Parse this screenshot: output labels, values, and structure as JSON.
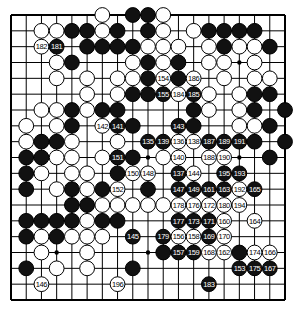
{
  "diagram": {
    "type": "go-board",
    "size": 19,
    "background": "#ffffff",
    "line_color": "#000000",
    "black_color": "#111111",
    "white_color": "#ffffff",
    "star_points": [
      [
        3,
        15
      ],
      [
        9,
        9
      ],
      [
        9,
        15
      ],
      [
        15,
        3
      ],
      [
        15,
        9
      ]
    ],
    "stones": [
      {
        "r": 0,
        "c": 6,
        "color": "W"
      },
      {
        "r": 0,
        "c": 8,
        "color": "B"
      },
      {
        "r": 0,
        "c": 9,
        "color": "B"
      },
      {
        "r": 0,
        "c": 10,
        "color": "W"
      },
      {
        "r": 1,
        "c": 2,
        "color": "W"
      },
      {
        "r": 1,
        "c": 3,
        "color": "W"
      },
      {
        "r": 1,
        "c": 4,
        "color": "B"
      },
      {
        "r": 1,
        "c": 5,
        "color": "B"
      },
      {
        "r": 1,
        "c": 6,
        "color": "W"
      },
      {
        "r": 1,
        "c": 7,
        "color": "B"
      },
      {
        "r": 1,
        "c": 9,
        "color": "B"
      },
      {
        "r": 1,
        "c": 10,
        "color": "W"
      },
      {
        "r": 1,
        "c": 12,
        "color": "W"
      },
      {
        "r": 1,
        "c": 13,
        "color": "B"
      },
      {
        "r": 1,
        "c": 14,
        "color": "B"
      },
      {
        "r": 1,
        "c": 15,
        "color": "B"
      },
      {
        "r": 1,
        "c": 16,
        "color": "B"
      },
      {
        "r": 2,
        "c": 2,
        "color": "W",
        "label": "182"
      },
      {
        "r": 2,
        "c": 3,
        "color": "B",
        "label": "181"
      },
      {
        "r": 2,
        "c": 5,
        "color": "B"
      },
      {
        "r": 2,
        "c": 6,
        "color": "B"
      },
      {
        "r": 2,
        "c": 7,
        "color": "B"
      },
      {
        "r": 2,
        "c": 8,
        "color": "B"
      },
      {
        "r": 2,
        "c": 9,
        "color": "W"
      },
      {
        "r": 2,
        "c": 10,
        "color": "W"
      },
      {
        "r": 2,
        "c": 11,
        "color": "W"
      },
      {
        "r": 2,
        "c": 13,
        "color": "W"
      },
      {
        "r": 2,
        "c": 14,
        "color": "B"
      },
      {
        "r": 2,
        "c": 15,
        "color": "W"
      },
      {
        "r": 2,
        "c": 16,
        "color": "W"
      },
      {
        "r": 2,
        "c": 17,
        "color": "B"
      },
      {
        "r": 3,
        "c": 3,
        "color": "W"
      },
      {
        "r": 3,
        "c": 4,
        "color": "B"
      },
      {
        "r": 3,
        "c": 8,
        "color": "W"
      },
      {
        "r": 3,
        "c": 9,
        "color": "B"
      },
      {
        "r": 3,
        "c": 10,
        "color": "W"
      },
      {
        "r": 3,
        "c": 11,
        "color": "B"
      },
      {
        "r": 3,
        "c": 13,
        "color": "W"
      },
      {
        "r": 3,
        "c": 14,
        "color": "W"
      },
      {
        "r": 3,
        "c": 16,
        "color": "W"
      },
      {
        "r": 4,
        "c": 3,
        "color": "W"
      },
      {
        "r": 4,
        "c": 5,
        "color": "W"
      },
      {
        "r": 4,
        "c": 7,
        "color": "W"
      },
      {
        "r": 4,
        "c": 8,
        "color": "W"
      },
      {
        "r": 4,
        "c": 9,
        "color": "B"
      },
      {
        "r": 4,
        "c": 10,
        "color": "W",
        "label": "154"
      },
      {
        "r": 4,
        "c": 11,
        "color": "B"
      },
      {
        "r": 4,
        "c": 12,
        "color": "W",
        "label": "186"
      },
      {
        "r": 4,
        "c": 14,
        "color": "W"
      },
      {
        "r": 4,
        "c": 16,
        "color": "W"
      },
      {
        "r": 4,
        "c": 17,
        "color": "W"
      },
      {
        "r": 5,
        "c": 5,
        "color": "W"
      },
      {
        "r": 5,
        "c": 7,
        "color": "W"
      },
      {
        "r": 5,
        "c": 8,
        "color": "B"
      },
      {
        "r": 5,
        "c": 9,
        "color": "B"
      },
      {
        "r": 5,
        "c": 10,
        "color": "B",
        "label": "155"
      },
      {
        "r": 5,
        "c": 11,
        "color": "W",
        "label": "184"
      },
      {
        "r": 5,
        "c": 12,
        "color": "B",
        "label": "185"
      },
      {
        "r": 5,
        "c": 13,
        "color": "W"
      },
      {
        "r": 5,
        "c": 15,
        "color": "W"
      },
      {
        "r": 5,
        "c": 16,
        "color": "B"
      },
      {
        "r": 5,
        "c": 17,
        "color": "B"
      },
      {
        "r": 6,
        "c": 2,
        "color": "W"
      },
      {
        "r": 6,
        "c": 3,
        "color": "W"
      },
      {
        "r": 6,
        "c": 4,
        "color": "B"
      },
      {
        "r": 6,
        "c": 5,
        "color": "W"
      },
      {
        "r": 6,
        "c": 6,
        "color": "B"
      },
      {
        "r": 6,
        "c": 7,
        "color": "B"
      },
      {
        "r": 6,
        "c": 12,
        "color": "B"
      },
      {
        "r": 6,
        "c": 13,
        "color": "W"
      },
      {
        "r": 6,
        "c": 15,
        "color": "W"
      },
      {
        "r": 6,
        "c": 16,
        "color": "B"
      },
      {
        "r": 6,
        "c": 18,
        "color": "B"
      },
      {
        "r": 7,
        "c": 1,
        "color": "W"
      },
      {
        "r": 7,
        "c": 3,
        "color": "W"
      },
      {
        "r": 7,
        "c": 4,
        "color": "B"
      },
      {
        "r": 7,
        "c": 6,
        "color": "W",
        "label": "142"
      },
      {
        "r": 7,
        "c": 7,
        "color": "B",
        "label": "141"
      },
      {
        "r": 7,
        "c": 8,
        "color": "B"
      },
      {
        "r": 7,
        "c": 11,
        "color": "B",
        "label": "143"
      },
      {
        "r": 7,
        "c": 12,
        "color": "B"
      },
      {
        "r": 7,
        "c": 15,
        "color": "W"
      },
      {
        "r": 7,
        "c": 16,
        "color": "W"
      },
      {
        "r": 7,
        "c": 17,
        "color": "B"
      },
      {
        "r": 8,
        "c": 1,
        "color": "W"
      },
      {
        "r": 8,
        "c": 2,
        "color": "B"
      },
      {
        "r": 8,
        "c": 3,
        "color": "B"
      },
      {
        "r": 8,
        "c": 4,
        "color": "W"
      },
      {
        "r": 8,
        "c": 7,
        "color": "W"
      },
      {
        "r": 8,
        "c": 9,
        "color": "B",
        "label": "135"
      },
      {
        "r": 8,
        "c": 10,
        "color": "B",
        "label": "139"
      },
      {
        "r": 8,
        "c": 11,
        "color": "W",
        "label": "136"
      },
      {
        "r": 8,
        "c": 12,
        "color": "W",
        "label": "138"
      },
      {
        "r": 8,
        "c": 13,
        "color": "B",
        "label": "187"
      },
      {
        "r": 8,
        "c": 14,
        "color": "B",
        "label": "189"
      },
      {
        "r": 8,
        "c": 15,
        "color": "B",
        "label": "191"
      },
      {
        "r": 8,
        "c": 16,
        "color": "B"
      },
      {
        "r": 8,
        "c": 18,
        "color": "B"
      },
      {
        "r": 9,
        "c": 1,
        "color": "B"
      },
      {
        "r": 9,
        "c": 2,
        "color": "B"
      },
      {
        "r": 9,
        "c": 3,
        "color": "W"
      },
      {
        "r": 9,
        "c": 4,
        "color": "W"
      },
      {
        "r": 9,
        "c": 6,
        "color": "W"
      },
      {
        "r": 9,
        "c": 7,
        "color": "B",
        "label": "151"
      },
      {
        "r": 9,
        "c": 8,
        "color": "B"
      },
      {
        "r": 9,
        "c": 10,
        "color": "W"
      },
      {
        "r": 9,
        "c": 11,
        "color": "W",
        "label": "140"
      },
      {
        "r": 9,
        "c": 13,
        "color": "W",
        "label": "188"
      },
      {
        "r": 9,
        "c": 14,
        "color": "W",
        "label": "190"
      },
      {
        "r": 9,
        "c": 17,
        "color": "B"
      },
      {
        "r": 10,
        "c": 1,
        "color": "B"
      },
      {
        "r": 10,
        "c": 2,
        "color": "W"
      },
      {
        "r": 10,
        "c": 4,
        "color": "W"
      },
      {
        "r": 10,
        "c": 5,
        "color": "W"
      },
      {
        "r": 10,
        "c": 7,
        "color": "B"
      },
      {
        "r": 10,
        "c": 8,
        "color": "W",
        "label": "150"
      },
      {
        "r": 10,
        "c": 9,
        "color": "W",
        "label": "148"
      },
      {
        "r": 10,
        "c": 11,
        "color": "B",
        "label": "137"
      },
      {
        "r": 10,
        "c": 12,
        "color": "W",
        "label": "144"
      },
      {
        "r": 10,
        "c": 14,
        "color": "B",
        "label": "195"
      },
      {
        "r": 10,
        "c": 15,
        "color": "B",
        "label": "193"
      },
      {
        "r": 11,
        "c": 1,
        "color": "B"
      },
      {
        "r": 11,
        "c": 3,
        "color": "W"
      },
      {
        "r": 11,
        "c": 4,
        "color": "B"
      },
      {
        "r": 11,
        "c": 5,
        "color": "W"
      },
      {
        "r": 11,
        "c": 6,
        "color": "B"
      },
      {
        "r": 11,
        "c": 7,
        "color": "W",
        "label": "152"
      },
      {
        "r": 11,
        "c": 9,
        "color": "B"
      },
      {
        "r": 11,
        "c": 11,
        "color": "B",
        "label": "147"
      },
      {
        "r": 11,
        "c": 12,
        "color": "B",
        "label": "149"
      },
      {
        "r": 11,
        "c": 13,
        "color": "B",
        "label": "161"
      },
      {
        "r": 11,
        "c": 14,
        "color": "B",
        "label": "163"
      },
      {
        "r": 11,
        "c": 15,
        "color": "W",
        "label": "192"
      },
      {
        "r": 11,
        "c": 16,
        "color": "B",
        "label": "165"
      },
      {
        "r": 12,
        "c": 4,
        "color": "B"
      },
      {
        "r": 12,
        "c": 5,
        "color": "B"
      },
      {
        "r": 12,
        "c": 6,
        "color": "W"
      },
      {
        "r": 12,
        "c": 7,
        "color": "W"
      },
      {
        "r": 12,
        "c": 8,
        "color": "W"
      },
      {
        "r": 12,
        "c": 9,
        "color": "W"
      },
      {
        "r": 12,
        "c": 10,
        "color": "W"
      },
      {
        "r": 12,
        "c": 11,
        "color": "W",
        "label": "178"
      },
      {
        "r": 12,
        "c": 12,
        "color": "W",
        "label": "176"
      },
      {
        "r": 12,
        "c": 13,
        "color": "W",
        "label": "172"
      },
      {
        "r": 12,
        "c": 14,
        "color": "W",
        "label": "180"
      },
      {
        "r": 12,
        "c": 15,
        "color": "W",
        "label": "194"
      },
      {
        "r": 13,
        "c": 1,
        "color": "B"
      },
      {
        "r": 13,
        "c": 2,
        "color": "B"
      },
      {
        "r": 13,
        "c": 3,
        "color": "B"
      },
      {
        "r": 13,
        "c": 4,
        "color": "B"
      },
      {
        "r": 13,
        "c": 5,
        "color": "W"
      },
      {
        "r": 13,
        "c": 6,
        "color": "B"
      },
      {
        "r": 13,
        "c": 7,
        "color": "B"
      },
      {
        "r": 13,
        "c": 11,
        "color": "B",
        "label": "177"
      },
      {
        "r": 13,
        "c": 12,
        "color": "B",
        "label": "173"
      },
      {
        "r": 13,
        "c": 13,
        "color": "B",
        "label": "171"
      },
      {
        "r": 13,
        "c": 14,
        "color": "W",
        "label": "160"
      },
      {
        "r": 13,
        "c": 16,
        "color": "W",
        "label": "164"
      },
      {
        "r": 14,
        "c": 1,
        "color": "B"
      },
      {
        "r": 14,
        "c": 2,
        "color": "W"
      },
      {
        "r": 14,
        "c": 3,
        "color": "B"
      },
      {
        "r": 14,
        "c": 4,
        "color": "W"
      },
      {
        "r": 14,
        "c": 5,
        "color": "W"
      },
      {
        "r": 14,
        "c": 6,
        "color": "W"
      },
      {
        "r": 14,
        "c": 8,
        "color": "B",
        "label": "145"
      },
      {
        "r": 14,
        "c": 10,
        "color": "B",
        "label": "179"
      },
      {
        "r": 14,
        "c": 11,
        "color": "W",
        "label": "156"
      },
      {
        "r": 14,
        "c": 12,
        "color": "W",
        "label": "158"
      },
      {
        "r": 14,
        "c": 13,
        "color": "B",
        "label": "169"
      },
      {
        "r": 14,
        "c": 14,
        "color": "W",
        "label": "170"
      },
      {
        "r": 15,
        "c": 2,
        "color": "W"
      },
      {
        "r": 15,
        "c": 5,
        "color": "W"
      },
      {
        "r": 15,
        "c": 10,
        "color": "B"
      },
      {
        "r": 15,
        "c": 11,
        "color": "B",
        "label": "157"
      },
      {
        "r": 15,
        "c": 12,
        "color": "B",
        "label": "159"
      },
      {
        "r": 15,
        "c": 13,
        "color": "W",
        "label": "168"
      },
      {
        "r": 15,
        "c": 14,
        "color": "W",
        "label": "162"
      },
      {
        "r": 15,
        "c": 15,
        "color": "B"
      },
      {
        "r": 15,
        "c": 16,
        "color": "W",
        "label": "174"
      },
      {
        "r": 15,
        "c": 17,
        "color": "W",
        "label": "166"
      },
      {
        "r": 16,
        "c": 1,
        "color": "B"
      },
      {
        "r": 16,
        "c": 3,
        "color": "W"
      },
      {
        "r": 16,
        "c": 5,
        "color": "W"
      },
      {
        "r": 16,
        "c": 8,
        "color": "B"
      },
      {
        "r": 16,
        "c": 15,
        "color": "B",
        "label": "153"
      },
      {
        "r": 16,
        "c": 16,
        "color": "B",
        "label": "175"
      },
      {
        "r": 16,
        "c": 17,
        "color": "B",
        "label": "167"
      },
      {
        "r": 17,
        "c": 2,
        "color": "W",
        "label": "146"
      },
      {
        "r": 17,
        "c": 7,
        "color": "W",
        "label": "196"
      },
      {
        "r": 17,
        "c": 13,
        "color": "B",
        "label": "183"
      }
    ]
  }
}
